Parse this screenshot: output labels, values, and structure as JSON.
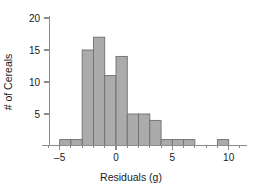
{
  "chart_data": {
    "type": "bar",
    "title": "",
    "subtitle": "",
    "xlabel": "Residuals (g)",
    "ylabel": "# of Cereals",
    "grid": false,
    "legend": "none",
    "bin_width": 1,
    "xlim": [
      -6,
      11
    ],
    "ylim": [
      0,
      21
    ],
    "xticks": [
      -5,
      0,
      5,
      10
    ],
    "xtick_labels": [
      "–5",
      "0",
      "5",
      "10"
    ],
    "yticks": [
      5,
      10,
      15,
      20
    ],
    "ytick_labels": [
      "5",
      "10",
      "15",
      "20"
    ],
    "categories": [
      "-5 to -4",
      "-4 to -3",
      "-3 to -2",
      "-2 to -1",
      "-1 to 0",
      "0 to 1",
      "1 to 2",
      "2 to 3",
      "3 to 4",
      "4 to 5",
      "5 to 6",
      "6 to 7",
      "7 to 8",
      "8 to 9",
      "9 to 10"
    ],
    "bin_starts": [
      -5,
      -4,
      -3,
      -2,
      -1,
      0,
      1,
      2,
      3,
      4,
      5,
      6,
      7,
      8,
      9
    ],
    "values": [
      1,
      1,
      15,
      17,
      11,
      14,
      5,
      5,
      4,
      1,
      1,
      1,
      0,
      0,
      1
    ],
    "bar_fill": "#ababab",
    "bar_stroke": "#6e6e6e",
    "axis_color": "#8c8c8c",
    "text_color": "#1a1a1a",
    "background": "#ffffff"
  }
}
